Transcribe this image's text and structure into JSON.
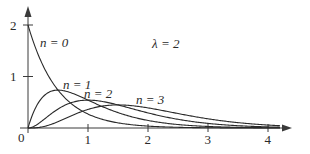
{
  "chart_data": {
    "type": "line",
    "title": "",
    "xlabel": "",
    "ylabel": "",
    "xlim": [
      0,
      4.3
    ],
    "ylim": [
      0,
      2.1
    ],
    "grid": false,
    "x_ticks": [
      "0",
      "1",
      "2",
      "3",
      "4"
    ],
    "y_ticks": [
      "1",
      "2"
    ],
    "origin_label": "0",
    "parameter_annotation": "λ = 2",
    "formula": "f_n(t) = λ^(n+1) t^n e^(−λt) / n!",
    "lambda": 2,
    "series": [
      {
        "name": "n = 0",
        "n": 0,
        "label": "n = 0",
        "peak": {
          "x": 0,
          "y": 2.0
        },
        "x": [
          0,
          0.25,
          0.5,
          0.75,
          1,
          1.5,
          2,
          2.5,
          3,
          3.5,
          4,
          4.2
        ],
        "values": [
          2.0,
          1.213,
          0.736,
          0.446,
          0.271,
          0.1,
          0.037,
          0.013,
          0.005,
          0.002,
          0.001,
          0.0
        ]
      },
      {
        "name": "n = 1",
        "n": 1,
        "label": "n = 1",
        "peak": {
          "x": 0.5,
          "y": 0.736
        },
        "x": [
          0,
          0.25,
          0.5,
          0.75,
          1,
          1.5,
          2,
          2.5,
          3,
          3.5,
          4,
          4.2
        ],
        "values": [
          0,
          0.607,
          0.736,
          0.669,
          0.541,
          0.299,
          0.147,
          0.067,
          0.03,
          0.013,
          0.005,
          0.004
        ]
      },
      {
        "name": "n = 2",
        "n": 2,
        "label": "n = 2",
        "peak": {
          "x": 1.0,
          "y": 0.541
        },
        "x": [
          0,
          0.25,
          0.5,
          0.75,
          1,
          1.5,
          2,
          2.5,
          3,
          3.5,
          4,
          4.2
        ],
        "values": [
          0,
          0.152,
          0.368,
          0.502,
          0.541,
          0.448,
          0.293,
          0.168,
          0.089,
          0.044,
          0.021,
          0.015
        ]
      },
      {
        "name": "n = 3",
        "n": 3,
        "label": "n = 3",
        "peak": {
          "x": 1.5,
          "y": 0.448
        },
        "x": [
          0,
          0.25,
          0.5,
          0.75,
          1,
          1.5,
          2,
          2.5,
          3,
          3.5,
          4,
          4.2
        ],
        "values": [
          0,
          0.025,
          0.123,
          0.251,
          0.361,
          0.448,
          0.391,
          0.28,
          0.179,
          0.104,
          0.057,
          0.044
        ]
      }
    ]
  },
  "colors": {
    "line": "#2a2a2a",
    "axis": "#3a3a3a",
    "background": "#ffffff"
  }
}
